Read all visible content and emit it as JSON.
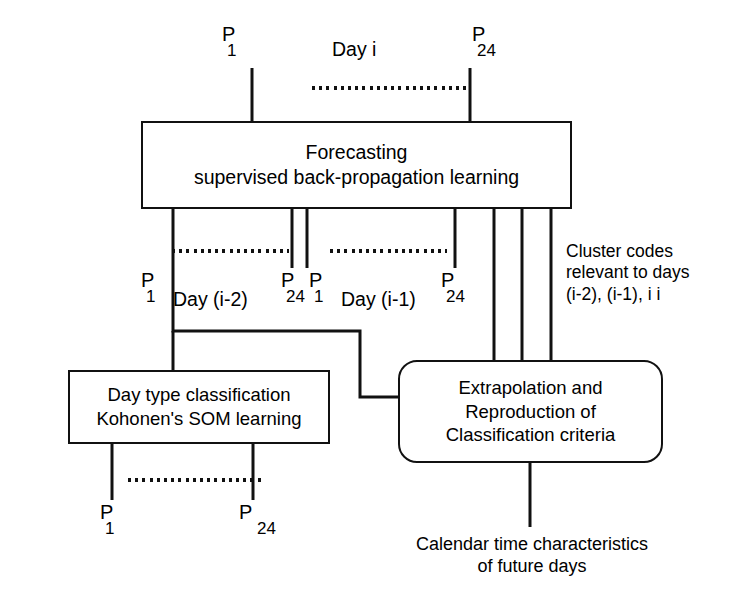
{
  "diagram": {
    "title_box": {
      "line1": "Forecasting",
      "line2": "supervised back-propagation learning"
    },
    "som_box": {
      "line1": "Day type classification",
      "line2": "Kohonen's SOM learning"
    },
    "extrapolation_box": {
      "line1": "Extrapolation and",
      "line2": "Reproduction of",
      "line3": "Classification criteria"
    },
    "labels": {
      "day_i": "Day i",
      "day_i_minus_2": "Day (i-2)",
      "day_i_minus_1": "Day (i-1)",
      "cluster_codes_line1": "Cluster codes",
      "cluster_codes_line2": "relevant to days",
      "cluster_codes_line3": "(i-2), (i-1), i i",
      "calendar_line1": "Calendar time characteristics",
      "calendar_line2": "of future days"
    },
    "port_labels": {
      "p": "P",
      "first": "1",
      "last": "24"
    },
    "colors": {
      "stroke": "#111111",
      "background": "#ffffff"
    }
  }
}
